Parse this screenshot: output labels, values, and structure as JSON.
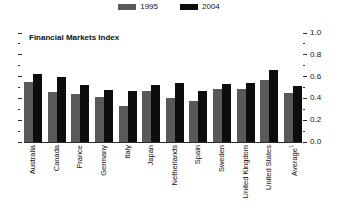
{
  "chart_data": {
    "type": "bar",
    "title": "Financial Markets Index",
    "xlabel": "",
    "ylabel": "",
    "ylim": [
      0.0,
      1.0
    ],
    "y_ticks": [
      "1.0",
      "0.8",
      "0.6",
      "0.4",
      "0.2",
      "0.0"
    ],
    "y_tick_values": [
      1.0,
      0.8,
      0.6,
      0.4,
      0.2,
      0.0
    ],
    "minor_ticks": true,
    "grid": false,
    "legend_position": "top-center",
    "categories": [
      "Australia",
      "Canada",
      "France",
      "Germany",
      "Italy",
      "Japan",
      "Netherlands",
      "Spain",
      "Sweden",
      "United Kingdom",
      "United States",
      "Average"
    ],
    "category_footnotes": {
      "Average": "1"
    },
    "series": [
      {
        "name": "1995",
        "color": "#595959",
        "values": [
          0.55,
          0.46,
          0.44,
          0.41,
          0.33,
          0.47,
          0.4,
          0.38,
          0.49,
          0.49,
          0.57,
          0.45
        ]
      },
      {
        "name": "2004",
        "color": "#0d0d0d",
        "values": [
          0.62,
          0.6,
          0.52,
          0.48,
          0.47,
          0.52,
          0.54,
          0.47,
          0.53,
          0.54,
          0.66,
          0.51
        ]
      }
    ]
  },
  "legend": {
    "entries": [
      {
        "label": "1995",
        "color": "#595959",
        "swatch_name": "legend-swatch-1995"
      },
      {
        "label": "2004",
        "color": "#0d0d0d",
        "swatch_name": "legend-swatch-2004"
      }
    ]
  }
}
